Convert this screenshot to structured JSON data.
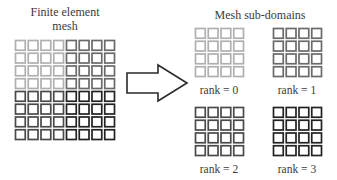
{
  "left_panel": {
    "title_line1": "Finite element",
    "title_line2": "mesh",
    "grid": {
      "rows": 8,
      "cols": 8
    },
    "quadrant_colors": {
      "top_left": "#b0b0b0",
      "top_right": "#6a6a6a",
      "bottom_left": "#4a4a4a",
      "bottom_right": "#222222"
    }
  },
  "arrow": {
    "icon": "right-arrow-icon",
    "direction": "right"
  },
  "right_panel": {
    "title": "Mesh sub-domains",
    "subdomains": [
      {
        "label": "rank = 0",
        "rank": 0,
        "color": "#b0b0b0",
        "rows": 4,
        "cols": 4
      },
      {
        "label": "rank = 1",
        "rank": 1,
        "color": "#6a6a6a",
        "rows": 4,
        "cols": 4
      },
      {
        "label": "rank = 2",
        "rank": 2,
        "color": "#4a4a4a",
        "rows": 4,
        "cols": 4
      },
      {
        "label": "rank = 3",
        "rank": 3,
        "color": "#222222",
        "rows": 4,
        "cols": 4
      }
    ]
  }
}
